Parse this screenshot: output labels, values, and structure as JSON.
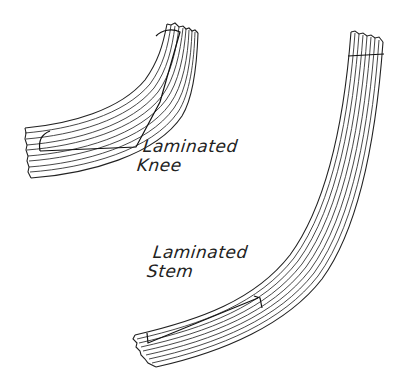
{
  "figure": {
    "type": "technical-sketch"
  },
  "labels": {
    "knee": {
      "line1": "Laminated",
      "line2": "Knee"
    },
    "stem": {
      "line1": "Laminated",
      "line2": "Stem"
    }
  },
  "parts": [
    {
      "name": "Laminated Knee",
      "laminations": 10
    },
    {
      "name": "Laminated Stem",
      "laminations": 9
    }
  ],
  "colors": {
    "line": "#222222",
    "background": "#ffffff"
  }
}
